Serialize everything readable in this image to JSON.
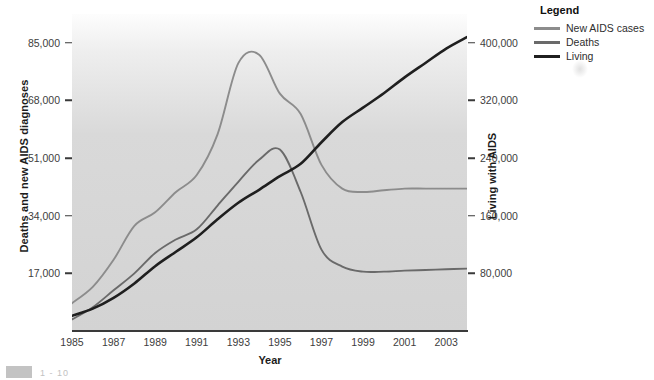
{
  "chart_data": {
    "type": "line",
    "title": "",
    "xlabel": "Year",
    "ylabel": "Deaths and new AIDS diagnoses",
    "y2label": "Living with AIDS",
    "grid": false,
    "legend_position": "top-right",
    "legend_title": "Legend",
    "xlim": [
      1985,
      2004
    ],
    "ylim": [
      0,
      93500
    ],
    "y2lim": [
      0,
      440000
    ],
    "xticks": [
      "1985",
      "1987",
      "1989",
      "1991",
      "1993",
      "1995",
      "1997",
      "1999",
      "2001",
      "2003"
    ],
    "xtick_values": [
      1985,
      1987,
      1989,
      1991,
      1993,
      1995,
      1997,
      1999,
      2001,
      2003
    ],
    "yticks": [
      "17,000",
      "34,000",
      "51,000",
      "68,000",
      "85,000"
    ],
    "ytick_values": [
      17000,
      34000,
      51000,
      68000,
      85000
    ],
    "y2ticks": [
      "80,000",
      "160,000",
      "240,000",
      "320,000",
      "400,000"
    ],
    "y2tick_values": [
      80000,
      160000,
      240000,
      320000,
      400000
    ],
    "x": [
      1985,
      1986,
      1987,
      1988,
      1989,
      1990,
      1991,
      1992,
      1993,
      1994,
      1995,
      1996,
      1997,
      1998,
      1999,
      2000,
      2001,
      2002,
      2003,
      2004
    ],
    "series": [
      {
        "name": "New AIDS cases",
        "axis": "left",
        "color": "#8c8c8c",
        "values": [
          8200,
          13000,
          21000,
          31000,
          35000,
          41000,
          46000,
          58000,
          79000,
          81500,
          70000,
          64000,
          49000,
          42000,
          41000,
          41500,
          42000,
          42000,
          42000,
          42000
        ]
      },
      {
        "name": "Deaths",
        "axis": "left",
        "color": "#6a6a6a",
        "values": [
          3400,
          7000,
          12000,
          17000,
          23000,
          27000,
          30000,
          37000,
          44000,
          50500,
          53500,
          41000,
          24000,
          19000,
          17500,
          17500,
          17800,
          18000,
          18200,
          18400
        ]
      },
      {
        "name": "Living",
        "axis": "right",
        "color": "#1f1f1f",
        "values": [
          21000,
          31000,
          46000,
          66000,
          90000,
          110000,
          130000,
          155000,
          178000,
          196000,
          215000,
          232000,
          262000,
          290000,
          310000,
          330000,
          352000,
          372000,
          392000,
          408000
        ]
      }
    ]
  },
  "legend": {
    "title": "Legend",
    "items": [
      {
        "label": "New AIDS cases",
        "color": "#8c8c8c"
      },
      {
        "label": "Deaths",
        "color": "#6a6a6a"
      },
      {
        "label": "Living",
        "color": "#1f1f1f"
      }
    ]
  },
  "axes": {
    "left_title": "Deaths and new AIDS diagnoses",
    "right_title": "Living with AIDS",
    "bottom_title": "Year"
  },
  "artifacts": {
    "footer_mark": "1 - 10"
  }
}
